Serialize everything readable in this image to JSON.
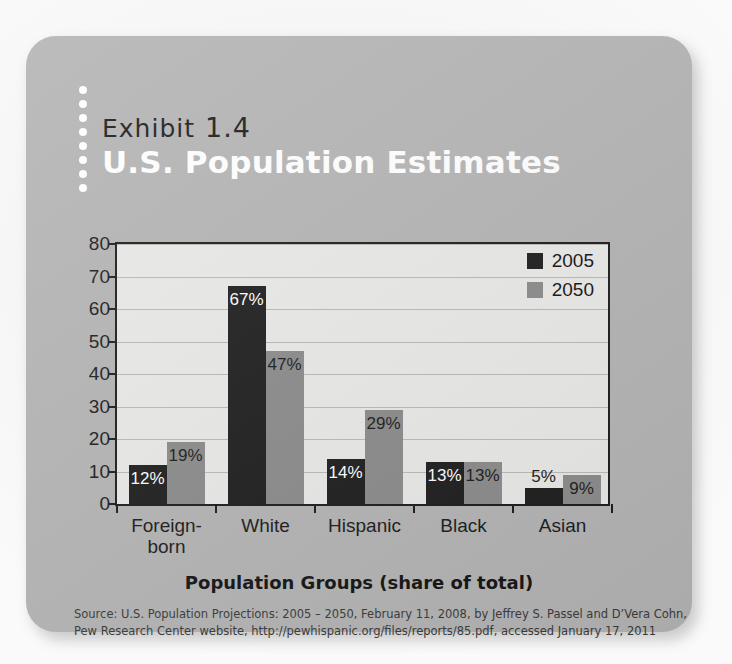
{
  "exhibit": {
    "label_word": "Exhibit",
    "number": "1.4",
    "title": "U.S. Population Estimates"
  },
  "colors": {
    "panel": "#b4b4b4",
    "plot_bg": "#e9e9e7",
    "series_2005": "#1e1e1e",
    "series_2050": "#8b8b8b",
    "axis": "#1c1c1c",
    "grid": "#b9b9b5"
  },
  "legend": {
    "position": "top-right",
    "entries": [
      {
        "label": "2005",
        "swatch": "dark"
      },
      {
        "label": "2050",
        "swatch": "gray"
      }
    ]
  },
  "axis_title": "Population Groups (share of total)",
  "source": {
    "line1": "Source: U.S. Population Projections: 2005 – 2050, February 11, 2008, by Jeffrey S. Passel and D’Vera Cohn,",
    "line2": "Pew Research Center website, http://pewhispanic.org/files/reports/85.pdf, accessed January 17, 2011"
  },
  "chart_data": {
    "type": "bar",
    "title": "U.S. Population Estimates",
    "xlabel": "Population Groups (share of total)",
    "ylabel": "",
    "ylim": [
      0,
      80
    ],
    "yticks": [
      0,
      10,
      20,
      30,
      40,
      50,
      60,
      70,
      80
    ],
    "ytick_labels": [
      "0",
      "10",
      "20",
      "30",
      "40",
      "50",
      "60",
      "70",
      "80"
    ],
    "grid": true,
    "legend_position": "upper right",
    "categories": [
      "Foreign-born",
      "White",
      "Hispanic",
      "Black",
      "Asian"
    ],
    "category_labels": [
      [
        "Foreign-",
        "born"
      ],
      [
        "White"
      ],
      [
        "Hispanic"
      ],
      [
        "Black"
      ],
      [
        "Asian"
      ]
    ],
    "series": [
      {
        "name": "2005",
        "color": "#1e1e1e",
        "values": [
          12,
          67,
          14,
          13,
          5
        ],
        "data_labels": [
          "12%",
          "67%",
          "14%",
          "13%",
          "5%"
        ]
      },
      {
        "name": "2050",
        "color": "#8b8b8b",
        "values": [
          19,
          47,
          29,
          13,
          9
        ],
        "data_labels": [
          "19%",
          "47%",
          "29%",
          "13%",
          "9%"
        ]
      }
    ]
  }
}
